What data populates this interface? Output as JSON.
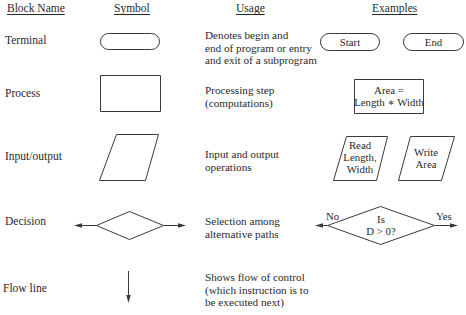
{
  "headers": {
    "block_name": "Block Name",
    "symbol": "Symbol",
    "usage": "Usage",
    "examples": "Examples"
  },
  "rows": [
    {
      "name": "Terminal",
      "symbol": "rounded-rectangle",
      "usage": [
        "Denotes begin and",
        "end of program or entry",
        "and exit of a subprogram"
      ],
      "examples": [
        "Start",
        "End"
      ]
    },
    {
      "name": "Process",
      "symbol": "rectangle",
      "usage": [
        "Processing step",
        "(computations)"
      ],
      "examples": [
        [
          "Area =",
          "Length ∗ Width"
        ]
      ]
    },
    {
      "name": "Input/output",
      "symbol": "parallelogram",
      "usage": [
        "Input and output",
        "operations"
      ],
      "examples": [
        [
          "Read",
          "Length,",
          "Width"
        ],
        [
          "Write",
          "Area"
        ]
      ]
    },
    {
      "name": "Decision",
      "symbol": "diamond",
      "usage": [
        "Selection among",
        "alternative paths"
      ],
      "examples": {
        "condition": [
          "Is",
          "D > 0?"
        ],
        "no": "No",
        "yes": "Yes"
      }
    },
    {
      "name": "Flow line",
      "symbol": "arrow-down",
      "usage": [
        "Shows flow of control",
        "(which instruction is to",
        "be executed next)"
      ],
      "examples": []
    }
  ],
  "colors": {
    "stroke": "#3a3a3a",
    "text": "#2a2a2a",
    "background": "#ffffff"
  }
}
